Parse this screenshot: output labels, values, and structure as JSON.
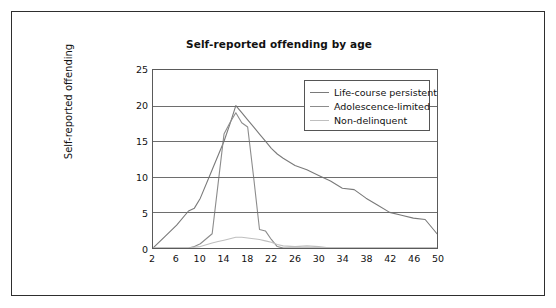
{
  "figure": {
    "title": "Self-reported offending by age",
    "border_color": "#2e2e2e",
    "background": "#ffffff"
  },
  "legend": {
    "position": "top-right-inside",
    "entries": [
      {
        "label": "Life-course persistent",
        "color": "#7a7a7a"
      },
      {
        "label": "Adolescence-limited",
        "color": "#8c8c8c"
      },
      {
        "label": "Non-delinquent",
        "color": "#bfbfbf"
      }
    ]
  },
  "axes": {
    "y_label": "Self-reported offending",
    "y_ticks": [
      "25",
      "20",
      "15",
      "10",
      "5",
      "0"
    ],
    "x_ticks": [
      "2",
      "6",
      "10",
      "14",
      "18",
      "22",
      "26",
      "30",
      "34",
      "38",
      "42",
      "46",
      "50"
    ],
    "x_label": ""
  },
  "chart_data": {
    "type": "line",
    "title": "Self-reported offending by age",
    "xlabel": "",
    "ylabel": "Self-reported offending",
    "xlim": [
      2,
      50
    ],
    "ylim": [
      0,
      25
    ],
    "y_ticks": [
      0,
      5,
      10,
      15,
      20,
      25
    ],
    "x_ticks": [
      2,
      6,
      10,
      14,
      18,
      22,
      26,
      30,
      34,
      38,
      42,
      46,
      50
    ],
    "grid": "horizontal",
    "legend_position": "upper right",
    "x": [
      2,
      4,
      6,
      8,
      9,
      10,
      12,
      13,
      14,
      15,
      16,
      17,
      18,
      19,
      20,
      21,
      22,
      23,
      24,
      26,
      28,
      30,
      32,
      34,
      36,
      38,
      40,
      42,
      44,
      46,
      48,
      50
    ],
    "series": [
      {
        "name": "Life-course persistent",
        "color": "#7a7a7a",
        "values": [
          0,
          1.6,
          3.2,
          5.2,
          5.6,
          7.0,
          11.0,
          13.0,
          15.0,
          17.4,
          20.0,
          19.0,
          18.0,
          17.0,
          16.0,
          15.0,
          14.0,
          13.2,
          12.6,
          11.6,
          11.0,
          10.2,
          9.4,
          8.4,
          8.2,
          7.0,
          6.0,
          5.0,
          4.6,
          4.2,
          4.0,
          2.0
        ]
      },
      {
        "name": "Adolescence-limited",
        "color": "#8c8c8c",
        "values": [
          0,
          0,
          0,
          0,
          0.2,
          0.6,
          2.0,
          9.0,
          16.0,
          17.6,
          19.0,
          17.6,
          17.0,
          10.0,
          2.6,
          2.4,
          1.2,
          0.2,
          0,
          0,
          0,
          0,
          0,
          0,
          0,
          0,
          0,
          0,
          0,
          0,
          0,
          0
        ]
      },
      {
        "name": "Non-delinquent",
        "color": "#bfbfbf",
        "values": [
          0,
          0,
          0,
          0,
          0.1,
          0.2,
          0.7,
          0.9,
          1.1,
          1.3,
          1.5,
          1.5,
          1.4,
          1.3,
          1.2,
          1.0,
          0.8,
          0.5,
          0.3,
          0.2,
          0.3,
          0.2,
          0,
          0,
          0,
          0,
          0,
          0,
          0,
          0,
          0,
          0
        ]
      }
    ]
  }
}
